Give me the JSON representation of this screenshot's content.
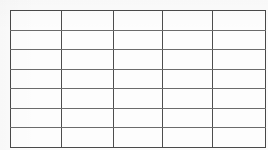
{
  "page": {
    "kind": "scanned-blank-table",
    "background_color": "#fbfbfb",
    "line_color": "#555555",
    "cell_fill_color": "#fdfdfd",
    "width": 268,
    "height": 150
  },
  "table": {
    "name": "blank-grid",
    "caption": "",
    "rows": 7,
    "columns": 5,
    "has_header_row": false,
    "bounds": {
      "x": 10,
      "y": 10,
      "width": 250,
      "height": 130
    },
    "column_widths": [
      50,
      51,
      48,
      49,
      52
    ],
    "row_height": 18.57,
    "column_headers": [
      "",
      "",
      "",
      "",
      ""
    ],
    "cells": [
      [
        "",
        "",
        "",
        "",
        ""
      ],
      [
        "",
        "",
        "",
        "",
        ""
      ],
      [
        "",
        "",
        "",
        "",
        ""
      ],
      [
        "",
        "",
        "",
        "",
        ""
      ],
      [
        "",
        "",
        "",
        "",
        ""
      ],
      [
        "",
        "",
        "",
        "",
        ""
      ],
      [
        "",
        "",
        "",
        "",
        ""
      ]
    ]
  }
}
